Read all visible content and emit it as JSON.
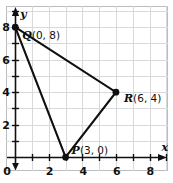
{
  "figure": {
    "background": "#ffffff",
    "frame_color": "#b9bcc0",
    "grid_color": "#d7d9dc",
    "axis_color": "#101010",
    "plot_color": "#101010"
  },
  "chart_data": {
    "type": "scatter",
    "title": "",
    "xlabel": "x",
    "ylabel": "y",
    "xlim": [
      -0.55,
      9.1
    ],
    "ylim": [
      -0.85,
      9.3
    ],
    "grid": true,
    "legend": "none",
    "xticks": [
      0,
      2,
      4,
      6,
      8
    ],
    "yticks": [
      0,
      2,
      4,
      6,
      8
    ],
    "xtick_labels": [
      "0",
      "2",
      "4",
      "6",
      "8"
    ],
    "ytick_labels": [
      "0",
      "2",
      "4",
      "6",
      "8"
    ],
    "minor_tick_step": 1,
    "points": [
      {
        "name": "Q",
        "x": 0,
        "y": 8,
        "label": "Q",
        "coords": "(0, 8)",
        "label_dx": 7,
        "label_dy": 3
      },
      {
        "name": "R",
        "x": 6,
        "y": 4,
        "label": "R",
        "coords": "(6, 4)",
        "label_dx": 8,
        "label_dy": 1
      },
      {
        "name": "P",
        "x": 3,
        "y": 0,
        "label": "P",
        "coords": "(3, 0)",
        "label_dx": 6,
        "label_dy": -12
      }
    ],
    "polygon": [
      "Q",
      "R",
      "P"
    ],
    "annotations": [
      {
        "id": "label-q",
        "text": "Q (0, 8)"
      },
      {
        "id": "label-r",
        "text": "R (6, 4)"
      },
      {
        "id": "label-p",
        "text": "P (3, 0)"
      }
    ]
  },
  "axes": {
    "x_axis_name": "x",
    "y_axis_name": "y",
    "origin_label": "0"
  },
  "labels": {
    "q_name": "Q",
    "q_coords": "(0, 8)",
    "r_name": "R",
    "r_coords": "(6, 4)",
    "p_name": "P",
    "p_coords": "(3, 0)"
  },
  "xtick_0": "0",
  "xtick_2": "2",
  "xtick_4": "4",
  "xtick_6": "6",
  "xtick_8": "8",
  "ytick_0": "0",
  "ytick_2": "2",
  "ytick_4": "4",
  "ytick_6": "6",
  "ytick_8": "8"
}
